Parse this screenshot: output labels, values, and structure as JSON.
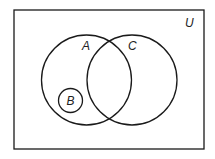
{
  "diagram": {
    "type": "venn",
    "universe_label": "U",
    "sets": [
      {
        "id": "A",
        "label": "A",
        "cx": 86.5,
        "cy": 80,
        "r": 45
      },
      {
        "id": "C",
        "label": "C",
        "cx": 132,
        "cy": 80,
        "r": 45
      },
      {
        "id": "B",
        "label": "B",
        "cx": 70.5,
        "cy": 100.5,
        "r": 12
      }
    ],
    "relations": [
      "B is a subset of A",
      "B does not intersect C",
      "A and C overlap"
    ],
    "stroke_color": "#1a1a1a"
  }
}
